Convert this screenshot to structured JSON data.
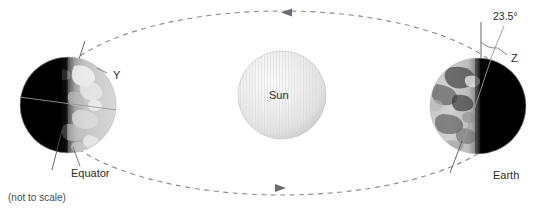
{
  "figure": {
    "title_alt": "Earth orbiting the Sun with axial tilt",
    "note": "(not to scale)",
    "background_color": "#ffffff"
  },
  "sun": {
    "label": "Sun",
    "cx": 282,
    "cy": 95,
    "r": 44,
    "fill_light": "#f4f4f4",
    "fill_mid": "#e3e3e3",
    "fill_edge": "#cfcfcf",
    "stripe_color": "#dcdcdc"
  },
  "orbit": {
    "cx": 282,
    "cy": 103,
    "rx": 235,
    "ry": 92,
    "stroke": "#8d8d94",
    "dash": "5 4.5",
    "arrows": [
      {
        "name": "orbit-arrow-top",
        "x": 288,
        "y": 13,
        "direction": "left"
      },
      {
        "name": "orbit-arrow-bottom",
        "x": 278,
        "y": 188,
        "direction": "right"
      }
    ]
  },
  "earth_left": {
    "name": "earth-left",
    "cx": 68,
    "cy": 105,
    "r": 48,
    "night_side": "left",
    "axis_tilt_deg": 23.5,
    "labels": {
      "pole_letter": "Y",
      "equator": "Equator"
    },
    "label_positions": {
      "pole_letter": {
        "x": 113,
        "y": 79
      },
      "equator": {
        "x": 71,
        "y": 177
      }
    },
    "ocean_dark": "#0a0a0a",
    "land_light": "#d8d8d8"
  },
  "earth_right": {
    "name": "earth-right",
    "cx": 478,
    "cy": 106,
    "r": 48,
    "night_side": "right",
    "axis_tilt_deg": 23.5,
    "labels": {
      "angle": "23.5°",
      "pole_letter": "Z",
      "planet": "Earth"
    },
    "label_positions": {
      "angle": {
        "x": 496,
        "y": 20
      },
      "pole_letter": {
        "x": 512,
        "y": 61
      },
      "planet": {
        "x": 495,
        "y": 178
      }
    },
    "ocean_dark": "#0a0a0a",
    "land_light": "#d8d8d8"
  },
  "colors": {
    "line": "#6e6e6e",
    "text": "#2b2b2b",
    "orbit": "#8d8d94"
  }
}
